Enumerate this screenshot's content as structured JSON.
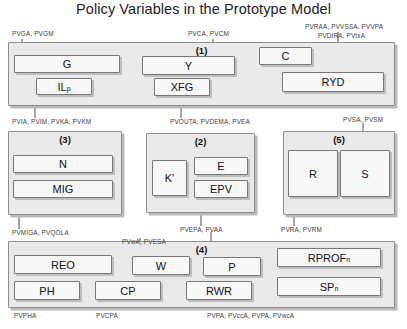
{
  "title": "Policy Variables in the Prototype Model",
  "groups": [
    {
      "id": "g1",
      "label": "(1)"
    },
    {
      "id": "g3",
      "label": "(3)"
    },
    {
      "id": "g2",
      "label": "(2)"
    },
    {
      "id": "g5",
      "label": "(5)"
    },
    {
      "id": "g4",
      "label": "(4)"
    }
  ],
  "boxes": {
    "g": "G",
    "il": "IL",
    "il_sub": "p",
    "y": "Y",
    "xfg": "XFG",
    "c": "C",
    "ryd": "RYD",
    "n": "N",
    "mig": "MIG",
    "kprime": "K'",
    "e": "E",
    "epv": "EPV",
    "r": "R",
    "s": "S",
    "reo": "REO",
    "w": "W",
    "p": "P",
    "rprof": "RPROF",
    "rprof_sub": "n",
    "ph": "PH",
    "cp": "CP",
    "rwr": "RWR",
    "sp": "SP",
    "sp_sub": "n"
  },
  "annotations": {
    "a_pvga": "PVGA, PVGM",
    "a_pvca": "PVCA, PVCM",
    "a_pvraa": "PVRAA, PVVSSA, PVVPA",
    "a_pvdira": "PVDIRA, PVtxA",
    "a_pvia": "PVIA, PVIM, PVKA, PVKM",
    "a_pvouta": "PVOUTA, PVDEMA, PVEA",
    "a_pvsa": "PVSA, PVSM",
    "a_pvmiga": "PVMIGA, PVQOLA",
    "a_pvepa": "PVEPA, PVAA",
    "a_pvra": "PVRA, PVRM",
    "a_pvwa": "PVwA, PVESA",
    "a_pvpha": "PVPHA",
    "a_pvcpa": "PVCPA",
    "a_pvpa": "PVPA, PVccA, PVPA, PVwcA"
  }
}
